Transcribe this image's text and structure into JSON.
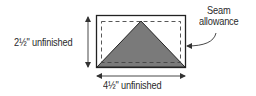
{
  "diagram": {
    "shape": "half-square triangle on rectangle",
    "labels": {
      "height": "2½\" unfinished",
      "width": "4½\" unfinished",
      "callout_line1": "Seam",
      "callout_line2": "allowance"
    },
    "colors": {
      "outline": "#222222",
      "triangle_fill": "#7a7a7a",
      "dashed_line": "#444444",
      "background": "#ffffff",
      "arrow": "#333333"
    },
    "geometry": {
      "outer_rect": {
        "x": 96,
        "y": 15,
        "w": 90,
        "h": 53
      },
      "dashed_rect": {
        "x": 101,
        "y": 21,
        "w": 80,
        "h": 41
      },
      "triangle": {
        "apex": [
          141,
          21
        ],
        "base_left": [
          97,
          67
        ],
        "base_right": [
          185,
          67
        ]
      },
      "height_arrow": {
        "x": 88,
        "y1": 16,
        "y2": 67
      },
      "width_arrow": {
        "y": 76,
        "x1": 97,
        "x2": 185
      }
    }
  }
}
